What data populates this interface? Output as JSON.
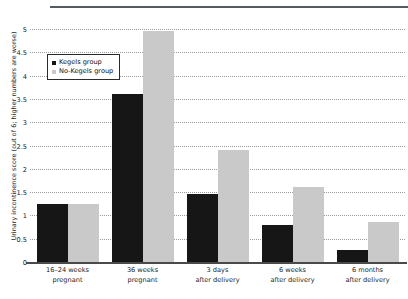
{
  "chart_data": {
    "type": "bar",
    "title": "",
    "xlabel": "",
    "ylabel": "Urinary incontinence score (out of 6; higher numbers are worse)",
    "ylim": [
      0,
      5
    ],
    "ytick_labels": [
      "0",
      "0.5",
      "1",
      "1.5",
      "2",
      "2.5",
      "3",
      "3.5",
      "4",
      "4.5",
      "5"
    ],
    "ytick_values": [
      0,
      0.5,
      1,
      1.5,
      2,
      2.5,
      3,
      3.5,
      4,
      4.5,
      5
    ],
    "grid": true,
    "legend_position": "upper-left-inset",
    "categories": [
      "16–24 weeks pregnant",
      "36 weeks pregnant",
      "3 days after delivery",
      "6 weeks after delivery",
      "6 months after delivery"
    ],
    "category_lines": [
      [
        "16–24 weeks",
        "pregnant"
      ],
      [
        "36 weeks",
        "pregnant"
      ],
      [
        "3 days",
        "after delivery"
      ],
      [
        "6 weeks",
        "after delivery"
      ],
      [
        "6 months",
        "after delivery"
      ]
    ],
    "series": [
      {
        "name": "Kegels group",
        "color": "#161616",
        "values": [
          1.25,
          3.6,
          1.45,
          0.8,
          0.25
        ]
      },
      {
        "name": "No-Kegels group",
        "color": "#c9c9c9",
        "values": [
          1.25,
          4.95,
          2.4,
          1.6,
          0.85
        ]
      }
    ]
  },
  "legend": {
    "items": [
      {
        "label": "Kegels group",
        "swatch": "dark-square-icon"
      },
      {
        "label": "No-Kegels group",
        "swatch": "light-square-icon"
      }
    ]
  },
  "colors": {
    "kegels": "#161616",
    "no_kegels": "#c9c9c9",
    "gridline": "#9a9a9a",
    "axis": "#4a4a4a",
    "rule": "#555a5e",
    "text": "#1c1c1c"
  }
}
